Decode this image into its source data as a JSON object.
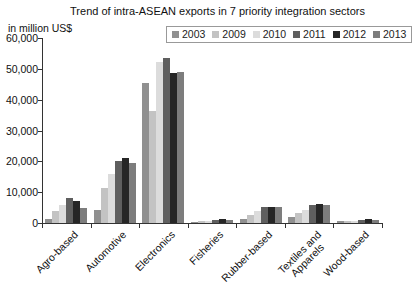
{
  "title": "Trend of intra-ASEAN exports in 7 priority integration sectors",
  "y_axis_unit": "in million US$",
  "chart_data": {
    "type": "bar",
    "title": "Trend of intra-ASEAN exports in 7 priority integration sectors",
    "ylabel": "in million US$",
    "xlabel": "",
    "ylim": [
      0,
      60000
    ],
    "yticks": [
      "0",
      "10,000",
      "20,000",
      "30,000",
      "40,000",
      "50,000",
      "60,000"
    ],
    "grid": false,
    "legend_position": "top-right",
    "categories": [
      "Agro-based",
      "Automotive",
      "Electronics",
      "Fisheries",
      "Rubber-based",
      "Textiles and\nApparels",
      "Wood-based"
    ],
    "series": [
      {
        "name": "2003",
        "color": "#909090",
        "values": [
          1400,
          4200,
          45300,
          400,
          1300,
          1900,
          600
        ]
      },
      {
        "name": "2009",
        "color": "#c3c3c3",
        "values": [
          4000,
          11300,
          36300,
          600,
          2700,
          3300,
          700
        ]
      },
      {
        "name": "2010",
        "color": "#dcdcdc",
        "values": [
          5800,
          15900,
          52200,
          700,
          3800,
          4300,
          800
        ]
      },
      {
        "name": "2011",
        "color": "#5f5f5f",
        "values": [
          8100,
          20000,
          53600,
          1100,
          5200,
          5700,
          1000
        ]
      },
      {
        "name": "2012",
        "color": "#262626",
        "values": [
          7100,
          21000,
          48800,
          1300,
          5300,
          6000,
          1300
        ]
      },
      {
        "name": "2013",
        "color": "#7d7d7d",
        "values": [
          5000,
          19400,
          49100,
          900,
          5100,
          5800,
          1000
        ]
      }
    ]
  }
}
